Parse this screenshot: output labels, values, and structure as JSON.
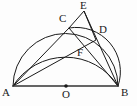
{
  "figure": {
    "background_color": "#fdfdfd",
    "stroke_color": "#1a1a1a",
    "label_color": "#1a1a1a",
    "baseline_color": "#333333"
  },
  "points": [
    {
      "id": "A",
      "label": "A",
      "x": 13,
      "y": 86,
      "label_x": 2,
      "label_y": 87,
      "marker": false
    },
    {
      "id": "B",
      "label": "B",
      "x": 118,
      "y": 86,
      "label_x": 121,
      "label_y": 87,
      "marker": false
    },
    {
      "id": "O",
      "label": "O",
      "x": 66,
      "y": 86,
      "label_x": 62,
      "label_y": 89,
      "marker": true
    },
    {
      "id": "C",
      "label": "C",
      "x": 69,
      "y": 28,
      "label_x": 59,
      "label_y": 13,
      "marker": false
    },
    {
      "id": "D",
      "label": "D",
      "x": 96,
      "y": 40,
      "label_x": 99,
      "label_y": 24,
      "marker": false
    },
    {
      "id": "E",
      "label": "E",
      "x": 84,
      "y": 11,
      "label_x": 80,
      "label_y": 0,
      "marker": false
    },
    {
      "id": "F",
      "label": "F",
      "x": 81,
      "y": 47,
      "label_x": 77,
      "label_y": 47,
      "marker": false
    }
  ],
  "segments": [
    {
      "id": "AB",
      "from": "A",
      "to": "B",
      "name": "segment-ab-baseline"
    },
    {
      "id": "AC",
      "from": "A",
      "to": "C",
      "name": "segment-ac"
    },
    {
      "id": "AD",
      "from": "A",
      "to": "D",
      "name": "segment-ad"
    },
    {
      "id": "BC",
      "from": "B",
      "to": "C",
      "name": "segment-bc"
    },
    {
      "id": "BE",
      "from": "B",
      "to": "E",
      "name": "segment-be"
    },
    {
      "id": "CE",
      "from": "C",
      "to": "E",
      "name": "segment-ce"
    },
    {
      "id": "DE",
      "from": "D",
      "to": "E",
      "name": "segment-de"
    }
  ],
  "arcs": [
    {
      "id": "semicircle-ab",
      "name": "arc-semicircle-on-ab",
      "description": "Semicircle with diameter AB, centre O",
      "path": "M 13 86 A 52.5 52.5 0 0 1 118 86"
    },
    {
      "id": "arc-acb",
      "name": "arc-through-c",
      "description": "Circular arc from A through C to B",
      "path": "M 13 86 A 62 62 0 0 1 118 86"
    },
    {
      "id": "arc-cdb",
      "name": "arc-through-d",
      "description": "Circular arc from C through D to B",
      "path": "M 69 28 A 44 44 0 0 1 118 86"
    }
  ],
  "labels": {
    "A": "A",
    "B": "B",
    "C": "C",
    "D": "D",
    "E": "E",
    "F": "F",
    "O": "O"
  }
}
